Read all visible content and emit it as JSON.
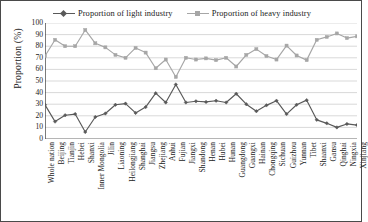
{
  "chart_data": {
    "type": "line",
    "title": "",
    "xlabel": "",
    "ylabel": "Proportion (%)",
    "ylim": [
      0,
      100
    ],
    "ytick_step": 10,
    "yticks": [
      100,
      90,
      80,
      70,
      60,
      50,
      40,
      30,
      20,
      10,
      0
    ],
    "grid": true,
    "legend_position": "top-center",
    "categories": [
      "Whole nation",
      "Beijing",
      "Tianjin",
      "Hebei",
      "Shanxi",
      "Inner Mongolia",
      "Jilin",
      "Liaoning",
      "Heilongjiang",
      "Shanghai",
      "Jiangsu",
      "Zhejiang",
      "Anhui",
      "Fujian",
      "Jiangxi",
      "Shandong",
      "Henan",
      "Hubei",
      "Hunan",
      "Guangdong",
      "Guangxi",
      "Hainan",
      "Chongqing",
      "Sichuan",
      "Guizhou",
      "Yunnan",
      "Tibet",
      "Shaanxi",
      "Gansu",
      "Qinghai",
      "Ningxia",
      "Xinjiang"
    ],
    "series": [
      {
        "name": "Proportion of light industry",
        "color": "#595959",
        "marker": "diamond",
        "values": [
          29.5,
          15.0,
          20.5,
          21.5,
          6.0,
          19.0,
          22.0,
          29.5,
          30.5,
          22.5,
          27.5,
          39.5,
          31.5,
          47.0,
          31.5,
          32.5,
          32.0,
          33.0,
          31.5,
          39.0,
          30.0,
          24.0,
          29.0,
          33.0,
          21.5,
          29.5,
          33.5,
          16.5,
          13.5,
          10.0,
          13.0,
          12.0
        ]
      },
      {
        "name": "Proportion of heavy industry",
        "color": "#a6a6a6",
        "marker": "square",
        "values": [
          71.5,
          85.5,
          80.0,
          80.0,
          94.0,
          82.5,
          79.0,
          72.5,
          70.0,
          78.5,
          74.5,
          61.0,
          68.5,
          53.5,
          70.0,
          68.5,
          69.5,
          68.0,
          70.0,
          62.5,
          72.5,
          77.5,
          71.5,
          68.5,
          80.5,
          72.0,
          68.0,
          85.5,
          88.0,
          91.0,
          87.0,
          88.5
        ]
      }
    ]
  },
  "legend": {
    "items": [
      {
        "label": "Proportion of light industry",
        "color": "#595959",
        "marker": "diamond"
      },
      {
        "label": "Proportion of heavy industry",
        "color": "#a6a6a6",
        "marker": "square"
      }
    ]
  },
  "axes": {
    "y_title": "Proportion (%)"
  },
  "colors": {
    "light_industry": "#595959",
    "heavy_industry": "#a6a6a6",
    "grid": "#c9c9c9",
    "axis": "#5a5a5a",
    "border": "#4a4a4a"
  }
}
